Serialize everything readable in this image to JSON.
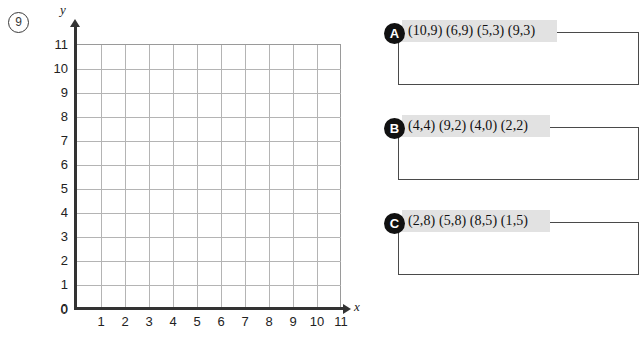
{
  "question": {
    "number": "9"
  },
  "graph": {
    "x_axis_label": "x",
    "y_axis_label": "y",
    "x_ticks": [
      "0",
      "1",
      "2",
      "3",
      "4",
      "5",
      "6",
      "7",
      "8",
      "9",
      "10",
      "11"
    ],
    "y_ticks": [
      "0",
      "1",
      "2",
      "3",
      "4",
      "5",
      "6",
      "7",
      "8",
      "9",
      "10",
      "11"
    ],
    "x_min": 0,
    "x_max": 11,
    "y_min": 0,
    "y_max": 11,
    "grid": true,
    "grid_color": "#b4b4b4",
    "axis_color": "#333333"
  },
  "answers": [
    {
      "badge": "A",
      "coordinates": "(10,9) (6,9) (5,3) (9,3)",
      "points": [
        [
          10,
          9
        ],
        [
          6,
          9
        ],
        [
          5,
          3
        ],
        [
          9,
          3
        ]
      ]
    },
    {
      "badge": "B",
      "coordinates": "(4,4) (9,2) (4,0) (2,2)",
      "points": [
        [
          4,
          4
        ],
        [
          9,
          2
        ],
        [
          4,
          0
        ],
        [
          2,
          2
        ]
      ]
    },
    {
      "badge": "C",
      "coordinates": "(2,8) (5,8) (8,5) (1,5)",
      "points": [
        [
          2,
          8
        ],
        [
          5,
          8
        ],
        [
          8,
          5
        ],
        [
          1,
          5
        ]
      ]
    }
  ],
  "colors": {
    "highlight": "#e2e2e2",
    "badge_background": "#111111",
    "badge_text": "#ffffff",
    "box_border": "#4a4a4a"
  }
}
